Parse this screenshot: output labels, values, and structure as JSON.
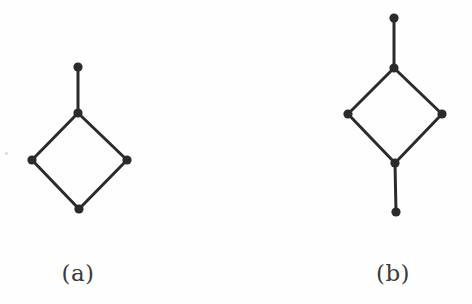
{
  "figure": {
    "background_color": "#fefefe",
    "ink_color": "#2b2b2b",
    "node_radius": 4.6,
    "edge_width": 3.0,
    "width": 472,
    "height": 304
  },
  "panels": [
    {
      "id": "a",
      "caption": "(a)",
      "description": "four-cycle with one pendant vertex attached to the top vertex",
      "node_count": 5,
      "edge_count": 5,
      "nodes": [
        {
          "name": "pendant-top",
          "x": 78,
          "y": 67
        },
        {
          "name": "apex-top",
          "x": 78,
          "y": 113
        },
        {
          "name": "left",
          "x": 32,
          "y": 160
        },
        {
          "name": "right",
          "x": 127,
          "y": 160
        },
        {
          "name": "bottom",
          "x": 79,
          "y": 209
        }
      ],
      "edges": [
        {
          "from": "pendant-top",
          "to": "apex-top"
        },
        {
          "from": "apex-top",
          "to": "left"
        },
        {
          "from": "apex-top",
          "to": "right"
        },
        {
          "from": "left",
          "to": "bottom"
        },
        {
          "from": "right",
          "to": "bottom"
        }
      ]
    },
    {
      "id": "b",
      "caption": "(b)",
      "description": "four-cycle with pendant vertices attached to both the top and bottom vertices",
      "node_count": 6,
      "edge_count": 6,
      "nodes": [
        {
          "name": "pendant-top",
          "x": 394,
          "y": 18
        },
        {
          "name": "apex-top",
          "x": 394,
          "y": 68
        },
        {
          "name": "left",
          "x": 348,
          "y": 114
        },
        {
          "name": "right",
          "x": 442,
          "y": 114
        },
        {
          "name": "apex-bottom",
          "x": 395,
          "y": 163
        },
        {
          "name": "pendant-bottom",
          "x": 396,
          "y": 212
        }
      ],
      "edges": [
        {
          "from": "pendant-top",
          "to": "apex-top"
        },
        {
          "from": "apex-top",
          "to": "left"
        },
        {
          "from": "apex-top",
          "to": "right"
        },
        {
          "from": "left",
          "to": "apex-bottom"
        },
        {
          "from": "right",
          "to": "apex-bottom"
        },
        {
          "from": "apex-bottom",
          "to": "pendant-bottom"
        }
      ]
    }
  ],
  "artifacts": [
    {
      "name": "scan-speck",
      "x": 5,
      "y": 152
    }
  ]
}
